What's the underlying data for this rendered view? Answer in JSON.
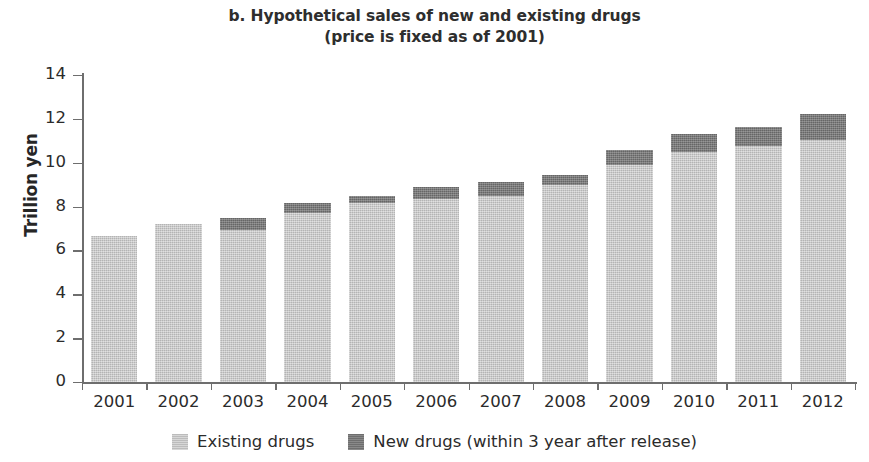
{
  "chart_data": {
    "type": "bar",
    "subtype": "stacked",
    "title": "b. Hypothetical sales of new and existing drugs",
    "subtitle": "(price is fixed as of 2001)",
    "xlabel": "",
    "ylabel": "Trillion yen",
    "categories": [
      "2001",
      "2002",
      "2003",
      "2004",
      "2005",
      "2006",
      "2007",
      "2008",
      "2009",
      "2010",
      "2011",
      "2012"
    ],
    "series": [
      {
        "name": "Existing drugs",
        "color": "#c6c6c6",
        "values": [
          6.65,
          7.2,
          6.95,
          7.7,
          8.15,
          8.35,
          8.5,
          9.0,
          9.9,
          10.5,
          10.75,
          11.05
        ]
      },
      {
        "name": "New drugs (within 3 year after release)",
        "color": "#767676",
        "values": [
          0.0,
          0.0,
          0.55,
          0.45,
          0.35,
          0.55,
          0.6,
          0.45,
          0.7,
          0.8,
          0.9,
          1.15
        ]
      }
    ],
    "totals": [
      6.65,
      7.2,
      7.5,
      8.15,
      8.5,
      8.9,
      9.1,
      9.45,
      10.6,
      11.3,
      11.65,
      12.2
    ],
    "ylim": [
      0,
      14
    ],
    "yticks": [
      0,
      2,
      4,
      6,
      8,
      10,
      12,
      14
    ],
    "ytick_labels": [
      "0",
      "2",
      "4",
      "6",
      "8",
      "10",
      "12",
      "14"
    ],
    "grid": false,
    "legend_position": "bottom",
    "legend_entries": [
      {
        "label": "Existing drugs",
        "color": "#c6c6c6",
        "swatch": "existing"
      },
      {
        "label": "New drugs (within 3 year after release)",
        "color": "#767676",
        "swatch": "new"
      }
    ],
    "axis_color": "#6e6e6e",
    "background": "#ffffff"
  }
}
